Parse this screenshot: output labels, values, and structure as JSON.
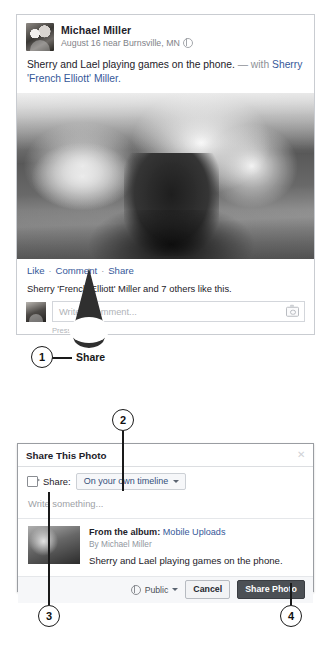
{
  "post": {
    "author": "Michael Miller",
    "meta": "August 16 near Burnsville, MN",
    "privacy_icon": "globe-icon",
    "body_text": "Sherry and Lael playing games on the phone.",
    "body_with": "— with",
    "body_tag": "Sherry 'French Elliott' Miller.",
    "photo_alt": "photo-of-woman-and-child-playing",
    "actions": {
      "like": "Like",
      "separator": "·",
      "comment": "Comment",
      "share": "Share"
    },
    "likes_line_prefix": "Sherry 'French Elliott' Miller and 7 others like this.",
    "composer": {
      "placeholder": "Write a comment...",
      "hint": "Press Enter...",
      "camera_icon": "camera-icon"
    }
  },
  "callouts": {
    "one": "1",
    "two": "2",
    "three": "3",
    "four": "4",
    "share_bubble_label": "Share"
  },
  "dialog": {
    "title": "Share This Photo",
    "close_icon": "close-icon",
    "share_icon": "share-arrow-icon",
    "share_label": "Share:",
    "audience_value": "On your own timeline",
    "caret_icon": "chevron-down-icon",
    "message_placeholder": "Write something...",
    "attachment": {
      "album_prefix": "From the album:",
      "album_name": "Mobile Uploads",
      "byline": "By Michael Miller",
      "caption": "Sherry and Lael playing games on the phone."
    },
    "footer": {
      "privacy_icon": "globe-icon",
      "privacy_value": "Public",
      "privacy_caret": "chevron-down-icon",
      "cancel_label": "Cancel",
      "submit_label": "Share Photo"
    }
  },
  "colors": {
    "link": "#365899",
    "text": "#1d2129",
    "muted": "#9197a0",
    "primary_button": "#4c5055",
    "border": "#c9ccd1"
  }
}
